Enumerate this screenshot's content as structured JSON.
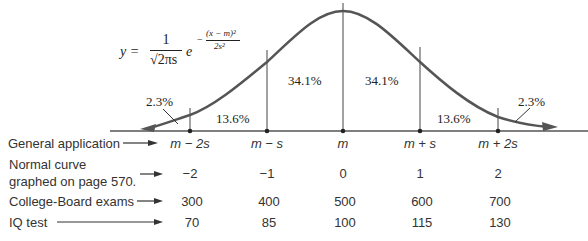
{
  "formula": {
    "lhs": "y =",
    "numerator": "1",
    "denominator": "√2πs",
    "base": "e",
    "exp_sign": "−",
    "exp_numerator": "(x − m)²",
    "exp_denominator": "2s²"
  },
  "regions": [
    {
      "label": "2.3%",
      "position": "left-tail"
    },
    {
      "label": "13.6%",
      "position": "m-2s to m-s"
    },
    {
      "label": "34.1%",
      "position": "m-s to m"
    },
    {
      "label": "34.1%",
      "position": "m to m+s"
    },
    {
      "label": "13.6%",
      "position": "m+s to m+2s"
    },
    {
      "label": "2.3%",
      "position": "right-tail"
    }
  ],
  "rows": [
    {
      "label": "General application",
      "values": [
        "m − 2s",
        "m − s",
        "m",
        "m + s",
        "m + 2s"
      ]
    },
    {
      "label_line1": "Normal curve",
      "label_line2": "graphed on page 570.",
      "values": [
        "−2",
        "−1",
        "0",
        "1",
        "2"
      ]
    },
    {
      "label": "College-Board exams",
      "values": [
        "300",
        "400",
        "500",
        "600",
        "700"
      ]
    },
    {
      "label": "IQ test",
      "values": [
        "70",
        "85",
        "100",
        "115",
        "130"
      ]
    }
  ],
  "colors": {
    "curve": "#555555",
    "axis": "#444444",
    "text": "#333333"
  }
}
